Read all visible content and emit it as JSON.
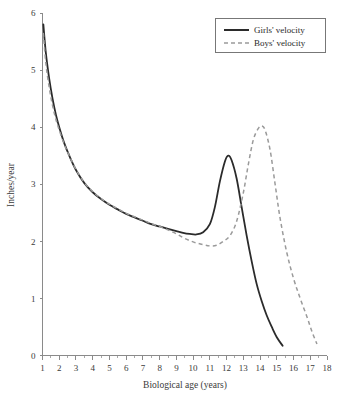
{
  "chart_data": {
    "type": "line",
    "title": "",
    "xlabel": "Biological age (years)",
    "ylabel": "Inches/year",
    "xlim": [
      1,
      18
    ],
    "ylim": [
      0,
      6
    ],
    "xticks": [
      1,
      2,
      3,
      4,
      5,
      6,
      7,
      8,
      9,
      10,
      11,
      12,
      13,
      14,
      15,
      16,
      17,
      18
    ],
    "yticks": [
      0,
      1,
      2,
      3,
      4,
      5,
      6
    ],
    "grid": false,
    "legend_position": "top-right",
    "colors": {
      "girls": "#2b2b2b",
      "boys": "#9a9a9a",
      "axis": "#8a8a8a",
      "text": "#3a3a3a",
      "background": "#ffffff"
    },
    "series": [
      {
        "name": "Girls' velocity",
        "style": "solid",
        "color": "#2b2b2b",
        "x": [
          1.05,
          1.2,
          1.4,
          1.6,
          1.8,
          2.0,
          2.3,
          2.6,
          3.0,
          3.5,
          4.0,
          4.5,
          5.0,
          5.5,
          6.0,
          6.5,
          7.0,
          7.5,
          8.0,
          8.5,
          9.0,
          9.4,
          9.8,
          10.2,
          10.6,
          11.0,
          11.3,
          11.6,
          11.9,
          12.1,
          12.3,
          12.6,
          12.9,
          13.2,
          13.5,
          13.8,
          14.1,
          14.4,
          14.7,
          15.0,
          15.35
        ],
        "y": [
          5.8,
          5.3,
          4.85,
          4.5,
          4.22,
          4.0,
          3.72,
          3.5,
          3.25,
          3.02,
          2.86,
          2.74,
          2.64,
          2.56,
          2.48,
          2.42,
          2.36,
          2.3,
          2.26,
          2.22,
          2.18,
          2.15,
          2.13,
          2.12,
          2.16,
          2.3,
          2.6,
          3.05,
          3.4,
          3.5,
          3.42,
          3.1,
          2.6,
          2.1,
          1.65,
          1.25,
          0.95,
          0.7,
          0.5,
          0.32,
          0.17
        ]
      },
      {
        "name": "Boys' velocity",
        "style": "dashed",
        "color": "#9a9a9a",
        "x": [
          1.05,
          1.2,
          1.4,
          1.6,
          1.8,
          2.0,
          2.3,
          2.6,
          3.0,
          3.5,
          4.0,
          4.5,
          5.0,
          5.5,
          6.0,
          6.5,
          7.0,
          7.5,
          8.0,
          8.5,
          9.0,
          9.5,
          10.0,
          10.5,
          11.0,
          11.4,
          11.8,
          12.2,
          12.6,
          13.0,
          13.3,
          13.6,
          13.9,
          14.1,
          14.3,
          14.6,
          14.9,
          15.2,
          15.6,
          16.0,
          16.4,
          16.8,
          17.1,
          17.4
        ],
        "y": [
          5.65,
          5.12,
          4.7,
          4.38,
          4.14,
          3.95,
          3.7,
          3.5,
          3.26,
          3.03,
          2.87,
          2.75,
          2.65,
          2.57,
          2.49,
          2.43,
          2.37,
          2.31,
          2.26,
          2.2,
          2.13,
          2.05,
          1.99,
          1.95,
          1.92,
          1.93,
          2.0,
          2.1,
          2.35,
          2.85,
          3.35,
          3.78,
          3.98,
          4.02,
          3.95,
          3.6,
          3.0,
          2.4,
          1.8,
          1.35,
          1.0,
          0.68,
          0.42,
          0.2
        ]
      }
    ]
  },
  "legend": {
    "items": [
      {
        "label": "Girls' velocity",
        "style": "solid"
      },
      {
        "label": "Boys' velocity",
        "style": "dashed"
      }
    ]
  }
}
